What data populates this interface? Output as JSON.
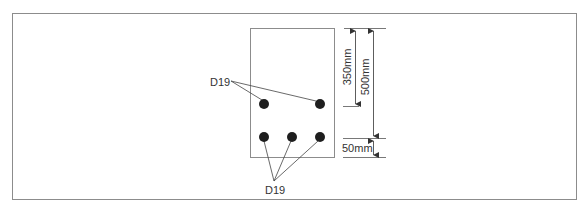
{
  "diagram": {
    "type": "rebar-cross-section",
    "section": {
      "x": 250,
      "y": 28,
      "width": 84,
      "height": 129,
      "stroke": "#8c8c8c"
    },
    "bars": {
      "top": [
        {
          "cx": 264,
          "cy": 104
        },
        {
          "cx": 320,
          "cy": 104
        }
      ],
      "bottom": [
        {
          "cx": 264,
          "cy": 137
        },
        {
          "cx": 292,
          "cy": 137
        },
        {
          "cx": 320,
          "cy": 137
        }
      ],
      "radius": 5,
      "fill": "#1e1e1e"
    },
    "labels": {
      "top_bar_label": "D19",
      "bottom_bar_label": "D19"
    },
    "dimensions": {
      "d350": "350mm",
      "d500": "500mm",
      "d50": "50mm"
    }
  }
}
